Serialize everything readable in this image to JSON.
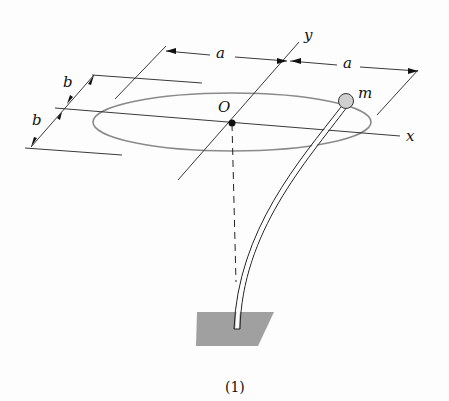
{
  "figure": {
    "caption": "(1)",
    "labels": {
      "a_left": "a",
      "a_right": "a",
      "b_top": "b",
      "b_bottom": "b",
      "origin": "O",
      "x_axis": "x",
      "y_axis": "y",
      "mass": "m"
    },
    "colors": {
      "ellipse": "#8a8a8a",
      "lines": "#222222",
      "base": "#8f8f8f",
      "ball": "#cfcfcf"
    }
  }
}
